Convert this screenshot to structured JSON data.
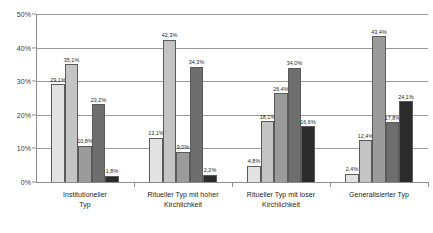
{
  "chart_data": {
    "type": "bar",
    "title": "",
    "subtitle": "",
    "xlabel": "",
    "ylabel": "",
    "ylim": [
      0,
      50
    ],
    "ytick_labels": [
      "0%",
      "10%",
      "20%",
      "30%",
      "40%",
      "50%"
    ],
    "ytick_values": [
      0,
      10,
      20,
      30,
      40,
      50
    ],
    "grid": true,
    "legend": "none",
    "value_suffix": "%",
    "decimal_separator": ",",
    "categories": [
      "Institutioneller\nTyp",
      "Ritueller Typ mit hoher\nKirchlichkeit",
      "Ritueller Typ mit loser\nKirchlichkeit",
      "Generalisierter Typ"
    ],
    "series": [
      {
        "name": "series-1",
        "color": "#e2e2e2",
        "values": [
          29.1,
          13.1,
          4.8,
          2.4
        ]
      },
      {
        "name": "series-2",
        "color": "#c4c4c4",
        "values": [
          35.1,
          42.3,
          18.1,
          12.4
        ]
      },
      {
        "name": "series-3",
        "color": "#9b9b9b",
        "values": [
          10.8,
          9.0,
          26.4,
          43.4
        ]
      },
      {
        "name": "series-4",
        "color": "#6e6e6e",
        "values": [
          23.2,
          34.3,
          34.0,
          17.8
        ]
      },
      {
        "name": "series-5",
        "color": "#2b2b2b",
        "values": [
          1.8,
          2.2,
          16.6,
          24.1
        ]
      }
    ],
    "data_labels": [
      [
        "29,1%",
        "35,1%",
        "10,8%",
        "23,2%",
        "1,8%"
      ],
      [
        "13,1%",
        "42,3%",
        "9,0%",
        "34,3%",
        "2,2%"
      ],
      [
        "4,8%",
        "18,1%",
        "26,4%",
        "34,0%",
        "16,6%"
      ],
      [
        "2,4%",
        "12,4%",
        "43,4%",
        "17,8%",
        "24,1%"
      ]
    ]
  }
}
